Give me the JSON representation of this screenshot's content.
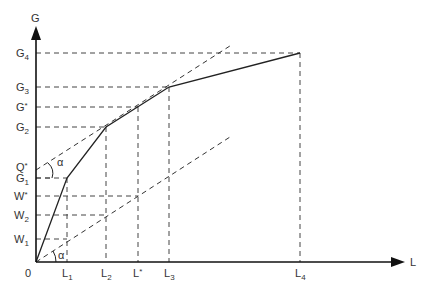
{
  "diagram": {
    "axes": {
      "y_label": "G",
      "x_label": "L",
      "origin_label": "0"
    },
    "y_ticks": [
      {
        "base": "G",
        "sub": "4",
        "y": 53
      },
      {
        "base": "G",
        "sub": "3",
        "y": 87
      },
      {
        "base": "G",
        "sub": "*",
        "y": 107
      },
      {
        "base": "G",
        "sub": "2",
        "y": 127
      },
      {
        "base": "Q",
        "sub": "*",
        "y": 170
      },
      {
        "base": "G",
        "sub": "1",
        "y": 178
      },
      {
        "base": "W",
        "sub": "*",
        "y": 196
      },
      {
        "base": "W",
        "sub": "2",
        "y": 215
      },
      {
        "base": "W",
        "sub": "1",
        "y": 239
      }
    ],
    "x_ticks": [
      {
        "base": "L",
        "sub": "1",
        "x": 67
      },
      {
        "base": "L",
        "sub": "2",
        "x": 106
      },
      {
        "base": "L",
        "sub": "*",
        "x": 138
      },
      {
        "base": "L",
        "sub": "3",
        "x": 169
      },
      {
        "base": "L",
        "sub": "4",
        "x": 300
      }
    ],
    "angle_label": "α",
    "solid_curve_points": [
      [
        36,
        262
      ],
      [
        67,
        178
      ],
      [
        106,
        127
      ],
      [
        169,
        87
      ],
      [
        300,
        53
      ]
    ],
    "upper_dashed_line": {
      "from": [
        36,
        170
      ],
      "to": [
        233,
        44
      ]
    },
    "lower_dashed_line": {
      "from": [
        36,
        262
      ],
      "to": [
        230,
        137
      ]
    }
  },
  "labels": {
    "G": "G",
    "L": "L",
    "zero": "0",
    "alpha_upper": "α",
    "alpha_lower": "α",
    "G4": "G",
    "G4s": "4",
    "G3": "G",
    "G3s": "3",
    "Gstar": "G",
    "Gstars": "*",
    "G2": "G",
    "G2s": "2",
    "Qstar": "Q",
    "Qstars": "*",
    "G1": "G",
    "G1s": "1",
    "Wstar": "W",
    "Wstars": "*",
    "W2": "W",
    "W2s": "2",
    "W1": "W",
    "W1s": "1",
    "L1": "L",
    "L1s": "1",
    "L2": "L",
    "L2s": "2",
    "Lstar": "L",
    "Lstars": "*",
    "L3": "L",
    "L3s": "3",
    "L4": "L",
    "L4s": "4"
  }
}
